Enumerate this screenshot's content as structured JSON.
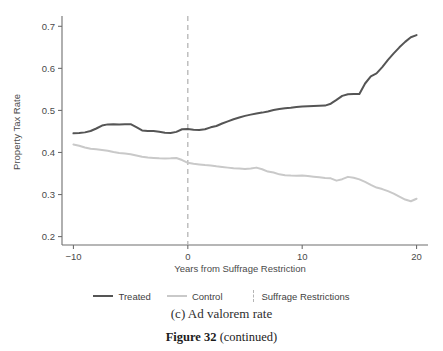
{
  "figure": {
    "subcaption": "(c) Ad valorem rate",
    "caption_number": "Figure 32",
    "caption_note": "(continued)"
  },
  "legend": {
    "items": [
      {
        "label": "Treated",
        "marker": "solid-line",
        "color": "#555555"
      },
      {
        "label": "Control",
        "marker": "solid-line",
        "color": "#c9c9c9"
      },
      {
        "label": "Suffrage Restrictions",
        "marker": "dashed-vline",
        "color": "#b5b5b5"
      }
    ]
  },
  "chart_data": {
    "type": "line",
    "title": "",
    "xlabel": "Years from Suffrage Restriction",
    "ylabel": "Property Tax Rate",
    "xlim": [
      -11,
      21
    ],
    "ylim": [
      0.18,
      0.715
    ],
    "xticks": [
      -10,
      0,
      10,
      20
    ],
    "xtick_labels": [
      "−10",
      "0",
      "10",
      "20"
    ],
    "yticks": [
      0.2,
      0.3,
      0.4,
      0.5,
      0.6,
      0.7
    ],
    "ytick_labels": [
      "0.2",
      "0.3",
      "0.4",
      "0.5",
      "0.6",
      "0.7"
    ],
    "grid": false,
    "legend_position": "below",
    "annotations": [
      {
        "type": "vline",
        "x": 0,
        "style": "dashed",
        "color": "#b5b5b5",
        "label": "Suffrage Restrictions"
      }
    ],
    "x": [
      -10,
      -9.5,
      -9,
      -8.5,
      -8,
      -7.5,
      -7,
      -6.5,
      -6,
      -5.5,
      -5,
      -4.5,
      -4,
      -3.5,
      -3,
      -2.5,
      -2,
      -1.5,
      -1,
      -0.5,
      0,
      0.5,
      1,
      1.5,
      2,
      2.5,
      3,
      3.5,
      4,
      4.5,
      5,
      5.5,
      6,
      6.5,
      7,
      7.5,
      8,
      8.5,
      9,
      9.5,
      10,
      10.5,
      11,
      11.5,
      12,
      12.5,
      13,
      13.5,
      14,
      14.5,
      15,
      15.5,
      16,
      16.5,
      17,
      17.5,
      18,
      18.5,
      19,
      19.5,
      20
    ],
    "series": [
      {
        "name": "Treated",
        "color": "#555555",
        "width": 2.0,
        "values": [
          0.4455,
          0.4462,
          0.4478,
          0.451,
          0.457,
          0.464,
          0.4668,
          0.467,
          0.4668,
          0.4672,
          0.4672,
          0.46,
          0.4525,
          0.451,
          0.4508,
          0.4492,
          0.447,
          0.4462,
          0.449,
          0.4552,
          0.456,
          0.454,
          0.4535,
          0.4552,
          0.4598,
          0.463,
          0.469,
          0.474,
          0.479,
          0.483,
          0.487,
          0.49,
          0.4925,
          0.4948,
          0.4975,
          0.501,
          0.5032,
          0.505,
          0.5062,
          0.508,
          0.5092,
          0.51,
          0.5108,
          0.5112,
          0.5115,
          0.516,
          0.525,
          0.5345,
          0.5385,
          0.5388,
          0.539,
          0.564,
          0.581,
          0.588,
          0.603,
          0.62,
          0.6355,
          0.65,
          0.663,
          0.674,
          0.679
        ]
      },
      {
        "name": "Control",
        "color": "#c9c9c9",
        "width": 2.0,
        "values": [
          0.419,
          0.416,
          0.412,
          0.409,
          0.4075,
          0.406,
          0.404,
          0.401,
          0.399,
          0.3975,
          0.396,
          0.393,
          0.39,
          0.388,
          0.387,
          0.3862,
          0.3858,
          0.3862,
          0.387,
          0.382,
          0.3755,
          0.373,
          0.3715,
          0.37,
          0.369,
          0.367,
          0.3655,
          0.364,
          0.3625,
          0.362,
          0.3605,
          0.362,
          0.364,
          0.36,
          0.3545,
          0.3522,
          0.348,
          0.346,
          0.345,
          0.3448,
          0.3452,
          0.344,
          0.3425,
          0.341,
          0.3395,
          0.3385,
          0.333,
          0.3365,
          0.342,
          0.34,
          0.336,
          0.33,
          0.323,
          0.3165,
          0.313,
          0.308,
          0.302,
          0.295,
          0.288,
          0.284,
          0.29
        ]
      }
    ]
  }
}
